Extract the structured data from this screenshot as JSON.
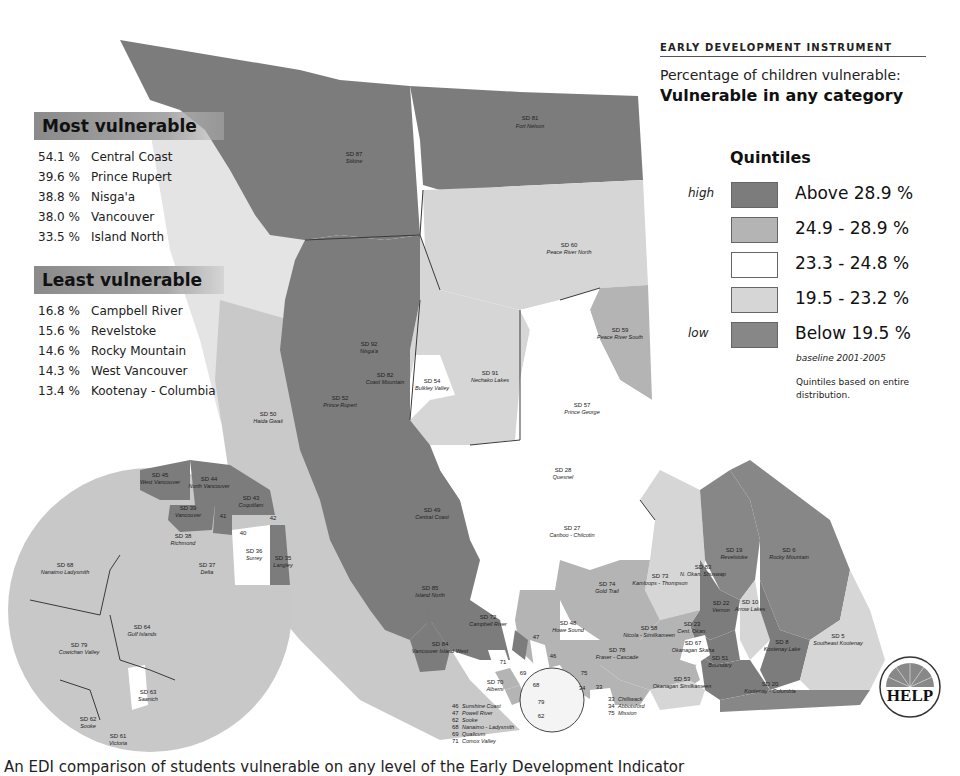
{
  "header": {
    "program": "Early Development Instrument",
    "subtitle": "Percentage of children vulnerable:",
    "title": "Vulnerable in any category"
  },
  "most_vulnerable": {
    "heading": "Most vulnerable",
    "items": [
      {
        "pct": "54.1 %",
        "name": "Central Coast"
      },
      {
        "pct": "39.6 %",
        "name": "Prince Rupert"
      },
      {
        "pct": "38.8 %",
        "name": "Nisga'a"
      },
      {
        "pct": "38.0 %",
        "name": "Vancouver"
      },
      {
        "pct": "33.5 %",
        "name": "Island North"
      }
    ]
  },
  "least_vulnerable": {
    "heading": "Least vulnerable",
    "items": [
      {
        "pct": "16.8 %",
        "name": "Campbell River"
      },
      {
        "pct": "15.6 %",
        "name": "Revelstoke"
      },
      {
        "pct": "14.6 %",
        "name": "Rocky Mountain"
      },
      {
        "pct": "14.3 %",
        "name": "West Vancouver"
      },
      {
        "pct": "13.4 %",
        "name": "Kootenay - Columbia"
      }
    ]
  },
  "legend": {
    "title": "Quintiles",
    "high_label": "high",
    "low_label": "low",
    "items": [
      {
        "label": "Above 28.9 %",
        "color": "#7c7c7c"
      },
      {
        "label": "24.9 - 28.9 %",
        "color": "#b4b4b4"
      },
      {
        "label": "23.3 - 24.8 %",
        "color": "#ffffff"
      },
      {
        "label": "19.5 - 23.2 %",
        "color": "#d6d6d6"
      },
      {
        "label": "Below 19.5 %",
        "color": "#878787"
      }
    ],
    "baseline": "baseline 2001-2005",
    "note": "Quintiles based on entire distribution."
  },
  "map": {
    "districts": [
      {
        "code": "SD 81",
        "name": "Fort Nelson"
      },
      {
        "code": "SD 87",
        "name": "Stikine"
      },
      {
        "code": "SD 60",
        "name": "Peace River North"
      },
      {
        "code": "SD 59",
        "name": "Peace River South"
      },
      {
        "code": "SD 92",
        "name": "Nisga'a"
      },
      {
        "code": "SD 82",
        "name": "Coast Mountain"
      },
      {
        "code": "SD 52",
        "name": "Prince Rupert"
      },
      {
        "code": "SD 54",
        "name": "Bulkley Valley"
      },
      {
        "code": "SD 91",
        "name": "Nechako Lakes"
      },
      {
        "code": "SD 57",
        "name": "Prince George"
      },
      {
        "code": "SD 50",
        "name": "Haida Gwaii"
      },
      {
        "code": "SD 28",
        "name": "Quesnel"
      },
      {
        "code": "SD 27",
        "name": "Cariboo - Chilcotin"
      },
      {
        "code": "SD 49",
        "name": "Central Coast"
      },
      {
        "code": "SD 19",
        "name": "Revelstoke"
      },
      {
        "code": "SD 6",
        "name": "Rocky Mountain"
      },
      {
        "code": "SD 83",
        "name": "N. Okan. Shuswap"
      },
      {
        "code": "SD 73",
        "name": "Kamloops - Thompson"
      },
      {
        "code": "SD 74",
        "name": "Gold Trail"
      },
      {
        "code": "SD 85",
        "name": "Island North"
      },
      {
        "code": "SD 72",
        "name": "Campbell River"
      },
      {
        "code": "SD 22",
        "name": "Vernon"
      },
      {
        "code": "SD 10",
        "name": "Arrow Lakes"
      },
      {
        "code": "SD 48",
        "name": "Howe Sound"
      },
      {
        "code": "SD 58",
        "name": "Nicola - Similkameen"
      },
      {
        "code": "SD 23",
        "name": "Cent. Okan."
      },
      {
        "code": "SD 67",
        "name": "Okanagan Skaha"
      },
      {
        "code": "SD 78",
        "name": "Fraser - Cascade"
      },
      {
        "code": "SD 51",
        "name": "Boundary"
      },
      {
        "code": "SD 8",
        "name": "Kootenay Lake"
      },
      {
        "code": "SD 5",
        "name": "Southeast Kootenay"
      },
      {
        "code": "SD 84",
        "name": "Vancouver Island West"
      },
      {
        "code": "SD 70",
        "name": "Alberni"
      },
      {
        "code": "SD 53",
        "name": "Okanagan Similkameen"
      },
      {
        "code": "SD 20",
        "name": "Kootenay - Columbia"
      }
    ],
    "small_numbers": [
      "47",
      "46",
      "71",
      "69",
      "68",
      "79",
      "62",
      "75",
      "34",
      "33"
    ],
    "south_key": [
      {
        "num": "46",
        "name": "Sunshine Coast"
      },
      {
        "num": "47",
        "name": "Powell River"
      },
      {
        "num": "62",
        "name": "Sooke"
      },
      {
        "num": "68",
        "name": "Nanaimo - Ladysmith"
      },
      {
        "num": "69",
        "name": "Qualicum"
      },
      {
        "num": "71",
        "name": "Comox Valley"
      }
    ],
    "fraser_key": [
      {
        "num": "33",
        "name": "Chilliwack"
      },
      {
        "num": "34",
        "name": "Abbotsford"
      },
      {
        "num": "75",
        "name": "Mission"
      }
    ],
    "inset": [
      {
        "code": "SD 45",
        "name": "West Vancouver"
      },
      {
        "code": "SD 44",
        "name": "North Vancouver"
      },
      {
        "code": "SD 43",
        "name": "Coquitlam"
      },
      {
        "code": "SD 39",
        "name": "Vancouver"
      },
      {
        "code": "41",
        "name": ""
      },
      {
        "code": "42",
        "name": ""
      },
      {
        "code": "40",
        "name": ""
      },
      {
        "code": "SD 38",
        "name": "Richmond"
      },
      {
        "code": "SD 36",
        "name": "Surrey"
      },
      {
        "code": "SD 35",
        "name": "Langley"
      },
      {
        "code": "SD 37",
        "name": "Delta"
      },
      {
        "code": "SD 68",
        "name": "Nanaimo Ladysmith"
      },
      {
        "code": "SD 64",
        "name": "Gulf Islands"
      },
      {
        "code": "SD 79",
        "name": "Cowichan Valley"
      },
      {
        "code": "SD 63",
        "name": "Saanich"
      },
      {
        "code": "SD 62",
        "name": "Sooke"
      },
      {
        "code": "SD 61",
        "name": "Victoria"
      }
    ]
  },
  "logo": {
    "text": "HELP",
    "arc_text": "HUMAN EARLY LEARNING PARTNERSHIP"
  },
  "caption": "An EDI comparison of students vulnerable on any level of the Early Development Indicator"
}
